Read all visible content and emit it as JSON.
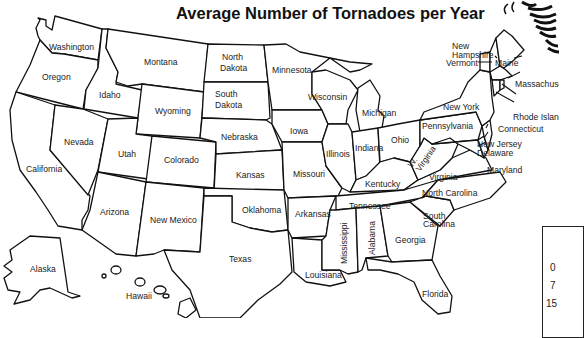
{
  "title": "Average Number of Tornadoes per Year",
  "states": {
    "washington": "Washington",
    "oregon": "Oregon",
    "california": "California",
    "nevada": "Nevada",
    "idaho": "Idaho",
    "montana": "Montana",
    "wyoming": "Wyoming",
    "utah": "Utah",
    "colorado": "Colorado",
    "arizona": "Arizona",
    "new_mexico": "New Mexico",
    "north_dakota_1": "North",
    "north_dakota_2": "Dakota",
    "south_dakota_1": "South",
    "south_dakota_2": "Dakota",
    "nebraska": "Nebraska",
    "kansas": "Kansas",
    "oklahoma": "Oklahoma",
    "texas": "Texas",
    "minnesota": "Minnesota",
    "iowa": "Iowa",
    "missouri": "Missouri",
    "arkansas": "Arkansas",
    "louisiana": "Louisiana",
    "wisconsin": "Wisconsin",
    "illinois": "Illinois",
    "michigan": "Michigan",
    "indiana": "Indiana",
    "ohio": "Ohio",
    "kentucky": "Kentucky",
    "tennessee": "Tennessee",
    "mississippi": "Mississippi",
    "alabama": "Alabama",
    "georgia": "Georgia",
    "florida": "Florida",
    "south_carolina_1": "South",
    "south_carolina_2": "Carolina",
    "north_carolina": "North Carolina",
    "virginia": "Virginia",
    "west_virginia_1": "W.",
    "west_virginia_2": "Virginia",
    "pennsylvania": "Pennsylvania",
    "new_york": "New York",
    "vermont": "Vermont",
    "new_hampshire_1": "New",
    "new_hampshire_2": "Hampshire",
    "maine": "Maine",
    "massachusetts": "Massachuse",
    "rhode_island": "Rhode Island",
    "connecticut": "Connecticut",
    "new_jersey": "New Jersey",
    "delaware": "Delaware",
    "maryland": "Maryland",
    "alaska": "Alaska",
    "hawaii": "Hawaii"
  },
  "legend": {
    "values": [
      "0",
      "7",
      "15"
    ]
  }
}
